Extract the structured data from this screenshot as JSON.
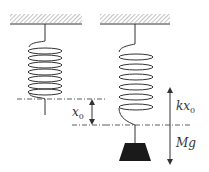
{
  "diagram": {
    "labels": {
      "x0": {
        "main": "x",
        "sub": "0"
      },
      "kx0": {
        "main": "kx",
        "sub": "0"
      },
      "Mg": {
        "main": "Mg"
      }
    },
    "colors": {
      "line": "#333333",
      "hatch": "#9a9a9a",
      "mass": "#1a1a1a"
    },
    "elements": [
      "left-ceiling",
      "left-spring",
      "equilibrium-line",
      "x0-displacement-arrow",
      "right-ceiling",
      "right-spring",
      "extended-line",
      "hanging-mass",
      "force-arrows"
    ]
  }
}
